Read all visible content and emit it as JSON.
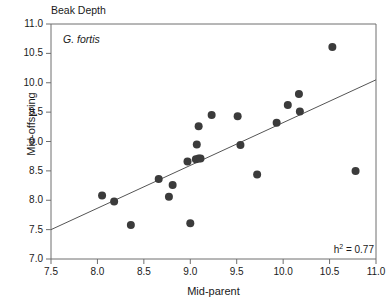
{
  "figure": {
    "title": "Beak Depth",
    "species_annotation": "G. fortis",
    "heritability_prefix": "h",
    "heritability_exponent": "2",
    "heritability_value": "= 0.77",
    "xlabel": "Mid-parent",
    "ylabel": "Mid-offspring"
  },
  "chart_data": {
    "type": "scatter",
    "title": "Beak Depth",
    "xlabel": "Mid-parent",
    "ylabel": "Mid-offspring",
    "xlim": [
      7.5,
      11.0
    ],
    "ylim": [
      7.0,
      11.0
    ],
    "xticks": [
      "7.5",
      "8.0",
      "8.5",
      "9.0",
      "9.5",
      "10.0",
      "10.5",
      "11.0"
    ],
    "xtick_values": [
      7.5,
      8.0,
      8.5,
      9.0,
      9.5,
      10.0,
      10.5,
      11.0
    ],
    "yticks": [
      "7.0",
      "7.5",
      "8.0",
      "8.5",
      "9.0",
      "9.5",
      "10.0",
      "10.5",
      "11.0"
    ],
    "ytick_values": [
      7.0,
      7.5,
      8.0,
      8.5,
      9.0,
      9.5,
      10.0,
      10.5,
      11.0
    ],
    "grid": false,
    "legend": false,
    "annotations": [
      {
        "text": "G. fortis",
        "x": 7.63,
        "y": 10.78,
        "style": "italic"
      },
      {
        "text": "h2 = 0.77",
        "x": 10.72,
        "y": 7.15,
        "style": "normal"
      }
    ],
    "marker": {
      "shape": "circle",
      "color": "#3b3b3b",
      "size": 7
    },
    "series": [
      {
        "name": "Mid-parent vs Mid-offspring",
        "points": [
          {
            "x": 8.05,
            "y": 8.08
          },
          {
            "x": 8.18,
            "y": 7.98
          },
          {
            "x": 8.36,
            "y": 7.58
          },
          {
            "x": 8.66,
            "y": 8.36
          },
          {
            "x": 8.77,
            "y": 8.06
          },
          {
            "x": 8.81,
            "y": 8.26
          },
          {
            "x": 8.97,
            "y": 8.66
          },
          {
            "x": 9.0,
            "y": 7.61
          },
          {
            "x": 9.06,
            "y": 8.7
          },
          {
            "x": 9.09,
            "y": 8.71
          },
          {
            "x": 9.11,
            "y": 8.71
          },
          {
            "x": 9.07,
            "y": 8.95
          },
          {
            "x": 9.09,
            "y": 9.26
          },
          {
            "x": 9.23,
            "y": 9.45
          },
          {
            "x": 9.51,
            "y": 9.43
          },
          {
            "x": 9.54,
            "y": 8.94
          },
          {
            "x": 9.72,
            "y": 8.44
          },
          {
            "x": 9.93,
            "y": 9.32
          },
          {
            "x": 10.05,
            "y": 9.62
          },
          {
            "x": 10.17,
            "y": 9.81
          },
          {
            "x": 10.18,
            "y": 9.51
          },
          {
            "x": 10.53,
            "y": 10.61
          },
          {
            "x": 10.78,
            "y": 8.5
          }
        ]
      }
    ],
    "regression_line": {
      "x_start": 7.5,
      "y_start": 7.5,
      "x_end": 11.0,
      "y_end": 10.05,
      "color": "#555555"
    }
  }
}
